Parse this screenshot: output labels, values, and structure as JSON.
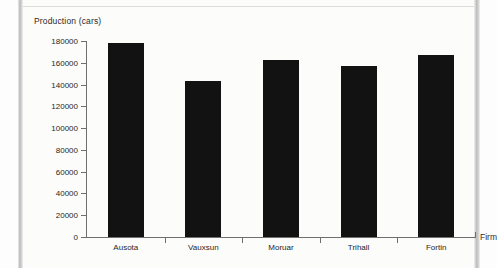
{
  "chart_data": {
    "type": "bar",
    "title": "",
    "xlabel": "Firm",
    "ylabel": "Production (cars)",
    "categories": [
      "Ausota",
      "Vauxsun",
      "Moruar",
      "Trihall",
      "Fortin"
    ],
    "values": [
      178000,
      143000,
      163000,
      157000,
      167500
    ],
    "ylim": [
      0,
      180000
    ],
    "ytick_step": 20000,
    "yticks": [
      0,
      20000,
      40000,
      60000,
      80000,
      100000,
      120000,
      140000,
      160000,
      180000
    ],
    "ytick_labels": [
      "0",
      "20000",
      "40000",
      "60000",
      "80000",
      "100000",
      "120000",
      "140000",
      "160000",
      "180000"
    ],
    "grid": false,
    "legend": null,
    "bar_color": "#121212",
    "axis_color": "#6f6f6f"
  },
  "page": {
    "background": "#fcfcfb",
    "edge_color": "#bcbcbc"
  }
}
